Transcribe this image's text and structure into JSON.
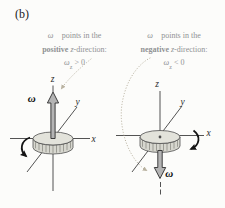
{
  "panel_label": "(b)",
  "captions": {
    "left": {
      "line1_omega": "ω⃗",
      "line1_rest": " points in the",
      "line2_bold": "positive",
      "line2_var": " z",
      "line2_rest": "-direction:",
      "line3_omega": "ω",
      "line3_sub": "z",
      "line3_rel": " > 0"
    },
    "right": {
      "line1_omega": "ω⃗",
      "line1_rest": " points in the",
      "line2_bold": "negative",
      "line2_var": " z",
      "line2_rest": "-direction:",
      "line3_omega": "ω",
      "line3_sub": "z",
      "line3_rel": " < 0"
    }
  },
  "diagrams": {
    "left": {
      "x_label": "x",
      "y_label": "y",
      "z_label": "z",
      "omega_label": "ω⃗"
    },
    "right": {
      "x_label": "x",
      "y_label": "y",
      "z_label": "z",
      "omega_label": "ω⃗"
    }
  },
  "colors": {
    "bg": "#fcfcfa",
    "panel_text": "#222222",
    "caption_text": "#909294",
    "label_text": "#2a2a2a",
    "omega_text": "#0d0d0d",
    "axis": "#3f3f3f",
    "leader": "#b9b2a0",
    "disk_fill": "#d7d7cf",
    "disk_top_fill": "#e3e3db",
    "disk_stroke": "#4f4f4f",
    "teeth": "#74746c",
    "arrow_fill": "#b4b4b4",
    "arrow_stroke": "#2d2d2d",
    "rotation_arrow": "#141414"
  }
}
